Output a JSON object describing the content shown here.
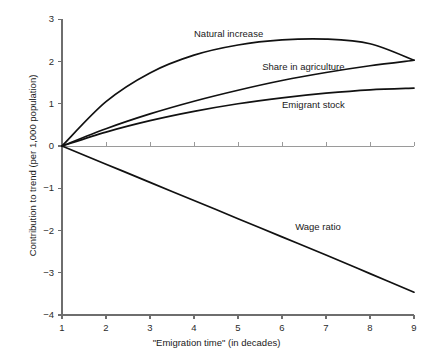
{
  "chart_data": {
    "type": "line",
    "title": "",
    "xlabel": "\"Emigration time\" (in decades)",
    "ylabel": "Contribution to trend (per 1,000 population)",
    "xlim": [
      1,
      9
    ],
    "ylim": [
      -4,
      3
    ],
    "xticks": [
      "1",
      "2",
      "3",
      "4",
      "5",
      "6",
      "7",
      "8",
      "9"
    ],
    "yticks": [
      "3",
      "2",
      "1",
      "0",
      "-1",
      "-2",
      "-3",
      "-4"
    ],
    "grid": false,
    "legend_position": "inline-annotations",
    "zero_reference_line": 0,
    "x": [
      1,
      2,
      3,
      4,
      5,
      6,
      7,
      8,
      9
    ],
    "series": [
      {
        "name": "Natural increase",
        "label_x": 4.0,
        "label_y": 2.62,
        "values": [
          0.0,
          1.05,
          1.73,
          2.15,
          2.39,
          2.51,
          2.53,
          2.42,
          2.03
        ]
      },
      {
        "name": "Share in agriculture",
        "label_x": 5.55,
        "label_y": 1.84,
        "values": [
          0.0,
          0.41,
          0.76,
          1.06,
          1.32,
          1.55,
          1.74,
          1.9,
          2.03
        ]
      },
      {
        "name": "Emigrant stock",
        "label_x": 6.0,
        "label_y": 0.95,
        "values": [
          0.0,
          0.33,
          0.6,
          0.82,
          1.0,
          1.14,
          1.25,
          1.33,
          1.37
        ]
      },
      {
        "name": "Wage ratio",
        "label_x": 6.3,
        "label_y": -1.93,
        "values": [
          0.0,
          -0.43,
          -0.86,
          -1.29,
          -1.72,
          -2.15,
          -2.58,
          -3.02,
          -3.46
        ]
      }
    ]
  }
}
